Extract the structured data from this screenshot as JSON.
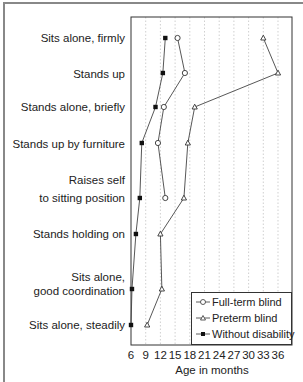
{
  "chart_data": {
    "type": "line",
    "title": "",
    "xlabel": "Age in months",
    "ylabel": "",
    "xlim": [
      6,
      39
    ],
    "x_ticks": [
      6,
      9,
      12,
      15,
      18,
      21,
      24,
      27,
      30,
      33,
      36
    ],
    "grid": "vertical dotted",
    "legend_position": "lower right",
    "categories": [
      "Sits alone, firmly",
      "Stands up",
      "Stands alone, briefly",
      "Stands up by furniture",
      "Raises self to sitting position",
      "Stands holding on",
      "Sits alone, good coordination",
      "Sits alone, steadily"
    ],
    "series": [
      {
        "name": "Full-term blind",
        "marker": "open-circle",
        "values": [
          15.5,
          17,
          12.7,
          11.5,
          13,
          null,
          null,
          null
        ]
      },
      {
        "name": "Preterm blind",
        "marker": "open-triangle",
        "values": [
          33,
          36,
          19,
          17.6,
          16.8,
          12,
          12.3,
          9.3
        ]
      },
      {
        "name": "Without disability",
        "marker": "filled-square",
        "values": [
          13,
          12.5,
          11,
          8.2,
          7.8,
          7,
          6.2,
          6
        ]
      }
    ]
  },
  "labels": [
    {
      "lines": [
        "Sits alone, firmly"
      ],
      "y": 31
    },
    {
      "lines": [
        "Stands up"
      ],
      "y": 67
    },
    {
      "lines": [
        "Stands alone, briefly"
      ],
      "y": 100
    },
    {
      "lines": [
        "Stands up by furniture"
      ],
      "y": 137
    },
    {
      "lines": [
        "Raises self"
      ],
      "y": 173
    },
    {
      "lines": [
        "to sitting position"
      ],
      "y": 191
    },
    {
      "lines": [
        "Stands holding on"
      ],
      "y": 227
    },
    {
      "lines": [
        "Sits alone,"
      ],
      "y": 270
    },
    {
      "lines": [
        "good coordination"
      ],
      "y": 284
    },
    {
      "lines": [
        "Sits alone, steadily"
      ],
      "y": 318
    }
  ],
  "ticks": [
    "6",
    "9",
    "12",
    "15",
    "18",
    "21",
    "24",
    "27",
    "30",
    "33",
    "36"
  ],
  "legend": [
    "Full-term blind",
    "Preterm blind",
    "Without disability"
  ]
}
